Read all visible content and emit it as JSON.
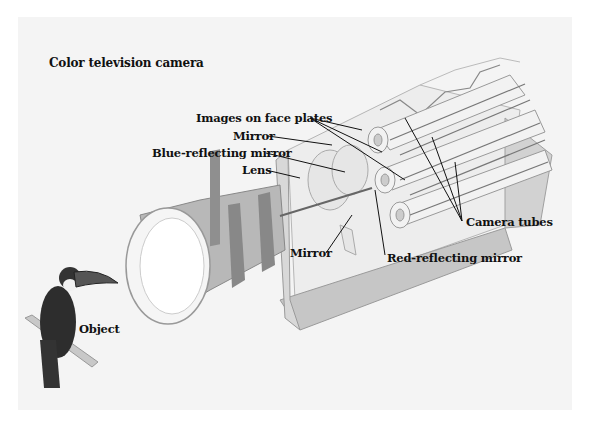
{
  "title": "Color television camera",
  "labels": {
    "images_on_face_plates": "Images on face plates",
    "mirror_top": "Mirror",
    "blue_reflecting_mirror": "Blue-reflecting mirror",
    "lens": "Lens",
    "mirror_bottom": "Mirror",
    "red_reflecting_mirror": "Red-reflecting mirror",
    "camera_tubes": "Camera tubes",
    "object": "Object"
  },
  "components": [
    "Object (toucan)",
    "Lens",
    "Blue-reflecting mirror",
    "Red-reflecting mirror",
    "Mirror",
    "Mirror",
    "Camera tubes",
    "Images on face plates"
  ],
  "colors": {
    "background": "#ffffff",
    "panel": "#f4f4f4",
    "text": "#111111",
    "housing": "#cfcfcf",
    "lens_body": "#a8a8a8"
  }
}
